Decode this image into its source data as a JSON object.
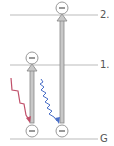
{
  "diagram": {
    "levels": [
      {
        "id": "level-2",
        "label": "2.",
        "y": 15
      },
      {
        "id": "level-1",
        "label": "1.",
        "y": 65
      },
      {
        "id": "level-ground",
        "label": "G",
        "y": 139
      }
    ],
    "electron_symbol": "−",
    "photons": [
      {
        "id": "red-photon",
        "color": "#c0506a",
        "type": "lower-energy"
      },
      {
        "id": "blue-photon",
        "color": "#4a6fc8",
        "type": "higher-energy"
      }
    ],
    "transitions": [
      {
        "id": "excitation-to-1",
        "from": "G",
        "to": "1."
      },
      {
        "id": "excitation-to-2",
        "from": "G",
        "to": "2."
      }
    ],
    "colors": {
      "level_line": "#bbbbbb",
      "arrow_fill": "#c8c8c8",
      "arrow_stroke": "#888888",
      "electron_stroke": "#999999"
    }
  }
}
